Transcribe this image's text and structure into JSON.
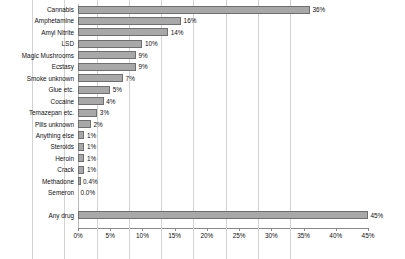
{
  "chart_data": {
    "type": "bar",
    "orientation": "horizontal",
    "title": "",
    "subtitle": "",
    "xlabel": "",
    "ylabel": "",
    "xlim": [
      0,
      45
    ],
    "xtick_labels": [
      "0%",
      "5%",
      "10%",
      "15%",
      "20%",
      "25%",
      "30%",
      "35%",
      "40%",
      "45%"
    ],
    "xtick_values": [
      0,
      5,
      10,
      15,
      20,
      25,
      30,
      35,
      40,
      45
    ],
    "grid": "vertical",
    "legend": "none",
    "bar_color": "#a8a8a8",
    "bar_edge_color": "#6f6f6f",
    "categories": [
      "Cannabis",
      "Amphetamine",
      "Amyl Nitrite",
      "LSD",
      "Magic Mushrooms",
      "Ecstasy",
      "Smoke unknown",
      "Glue etc.",
      "Cocaine",
      "Temazepan etc.",
      "Pills unknown",
      "Anything else",
      "Steroids",
      "Heroin",
      "Crack",
      "Methadone",
      "Semeron",
      "Any drug"
    ],
    "values": [
      36,
      16,
      14,
      10,
      9,
      9,
      7,
      5,
      4,
      3,
      2,
      1,
      1,
      1,
      1,
      0.4,
      0.0,
      45
    ],
    "data_labels": [
      "36%",
      "16%",
      "14%",
      "10%",
      "9%",
      "9%",
      "7%",
      "5%",
      "4%",
      "3%",
      "2%",
      "1%",
      "1%",
      "1%",
      "1%",
      "0.4%",
      "0.0%",
      "45%"
    ],
    "summary_row_index": 17,
    "gap_before_summary": true
  }
}
